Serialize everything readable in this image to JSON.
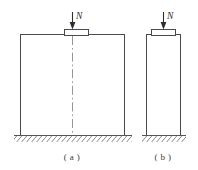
{
  "figure": {
    "colors": {
      "structure_stroke": "#4a4a4a",
      "ground_stroke": "#555555",
      "hatch_stroke": "#666666",
      "centerline_stroke": "#8a8a8a",
      "arrow_fill": "#2e2e2e",
      "label_fill": "#3a3a3a",
      "background": "#ffffff"
    },
    "subfigures": [
      {
        "key": "a",
        "caption": "( a )",
        "load_label": "N",
        "load_direction": "down",
        "has_centerline": true,
        "column": {
          "x": 20,
          "y": 34,
          "width": 104,
          "height": 101
        },
        "bearing_plate": {
          "x": 64,
          "y": 29,
          "width": 24,
          "height": 6
        },
        "centerline": {
          "x": 72,
          "y_top": 36,
          "y_bottom": 136
        },
        "arrow": {
          "x": 72,
          "y_top": 12,
          "y_bottom": 29
        },
        "label_pos": {
          "x": 76,
          "y": 19
        },
        "ground": {
          "x1": 14,
          "x2": 132,
          "y": 135
        },
        "caption_pos": {
          "x": 72,
          "y": 160
        }
      },
      {
        "key": "b",
        "caption": "( b )",
        "load_label": "N",
        "load_direction": "down",
        "has_centerline": false,
        "column": {
          "x": 146,
          "y": 34,
          "width": 34,
          "height": 101
        },
        "bearing_plate": {
          "x": 151,
          "y": 29,
          "width": 24,
          "height": 6
        },
        "centerline": null,
        "arrow": {
          "x": 163,
          "y_top": 12,
          "y_bottom": 29
        },
        "label_pos": {
          "x": 167,
          "y": 19
        },
        "ground": {
          "x1": 142,
          "x2": 186,
          "y": 135
        },
        "caption_pos": {
          "x": 163,
          "y": 160
        }
      }
    ]
  }
}
